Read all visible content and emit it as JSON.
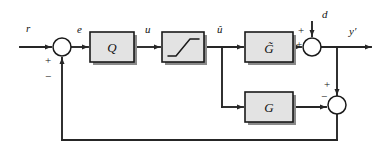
{
  "diagram": {
    "type": "control-system-block-diagram",
    "canvas": {
      "width": 379,
      "height": 159,
      "background": "#ffffff"
    },
    "colors": {
      "block_fill": "#e3e3e3",
      "block_stroke": "#1a1a1a",
      "line": "#262626",
      "shadow": "#8a8a8a",
      "circle_fill": "#ffffff"
    },
    "signals": {
      "reference": "r",
      "error": "e",
      "control": "u",
      "saturated_control": "û",
      "disturbance": "d",
      "output": "y′"
    },
    "blocks": [
      {
        "id": "controller",
        "label": "Q",
        "x": 90,
        "y": 32,
        "w": 44,
        "h": 30
      },
      {
        "id": "saturation",
        "label": "",
        "icon": "saturation-curve",
        "x": 162,
        "y": 32,
        "w": 42,
        "h": 30
      },
      {
        "id": "model",
        "label": "G̃",
        "x": 245,
        "y": 32,
        "w": 48,
        "h": 30
      },
      {
        "id": "plant",
        "label": "G",
        "x": 245,
        "y": 92,
        "w": 48,
        "h": 30
      }
    ],
    "summing_junctions": [
      {
        "id": "error-sum",
        "cx": 62,
        "cy": 47,
        "r": 9,
        "signs": [
          {
            "label": "+",
            "position": "left-below"
          },
          {
            "label": "−",
            "position": "bottom-left"
          }
        ]
      },
      {
        "id": "disturbance-sum",
        "cx": 312,
        "cy": 47,
        "r": 9,
        "signs": [
          {
            "label": "+",
            "position": "left"
          },
          {
            "label": "+",
            "position": "top-left"
          }
        ]
      },
      {
        "id": "feedback-sum",
        "cx": 337,
        "cy": 105,
        "r": 9,
        "signs": [
          {
            "label": "−",
            "position": "left"
          },
          {
            "label": "+",
            "position": "top-left"
          }
        ]
      }
    ],
    "signal_labels": [
      {
        "name": "reference-label",
        "text": "r",
        "x": 26,
        "y": 32
      },
      {
        "name": "error-label",
        "text": "e",
        "x": 77,
        "y": 33
      },
      {
        "name": "control-label",
        "text": "u",
        "x": 145,
        "y": 33
      },
      {
        "name": "saturated-control-label",
        "text": "û",
        "x": 219,
        "y": 33
      },
      {
        "name": "disturbance-label",
        "text": "d",
        "x": 323,
        "y": 17
      },
      {
        "name": "output-label",
        "text": "y′",
        "x": 350,
        "y": 34
      }
    ],
    "sign_labels": [
      {
        "name": "error-sum-plus",
        "text": "+",
        "x": 48,
        "y": 63
      },
      {
        "name": "error-sum-minus",
        "text": "−",
        "x": 48,
        "y": 78
      },
      {
        "name": "disturbance-sum-plus-left",
        "text": "+",
        "x": 298,
        "y": 48
      },
      {
        "name": "disturbance-sum-plus-top",
        "text": "+",
        "x": 300,
        "y": 33
      },
      {
        "name": "feedback-sum-minus",
        "text": "−",
        "x": 323,
        "y": 99
      },
      {
        "name": "feedback-sum-plus",
        "text": "+",
        "x": 326,
        "y": 86
      }
    ],
    "branch_points": [
      {
        "name": "u-hat-branch",
        "x": 222,
        "y": 47
      },
      {
        "name": "output-branch",
        "x": 337,
        "y": 47
      }
    ],
    "feedback_path": {
      "description": "Output of feedback summing junction returns along the bottom to the error junction",
      "bottom_y": 140,
      "left_x": 62,
      "right_x": 337
    }
  }
}
